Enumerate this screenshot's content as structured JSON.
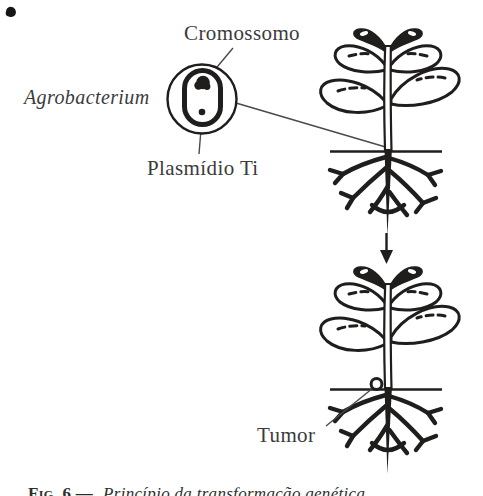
{
  "colors": {
    "background": "#ffffff",
    "ink": "#1f1e1c",
    "label": "#3b3b3b"
  },
  "labels": {
    "chromosome": "Cromossomo",
    "bacterium": "Agrobacterium",
    "plasmid": "Plasmídio Ti",
    "tumor": "Tumor"
  },
  "caption": {
    "prefix": "Fig. 6 —",
    "text": "Princípio da transformação genética"
  }
}
